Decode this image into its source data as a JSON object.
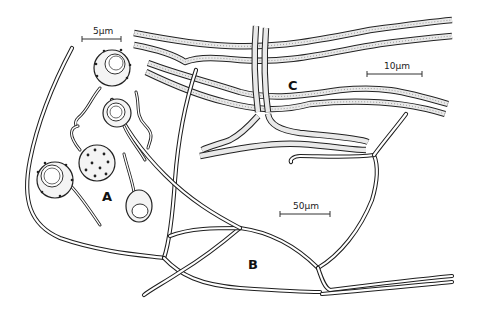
{
  "figure": {
    "panels": [
      {
        "id": "A",
        "label": "A",
        "content": "Spores with germ tubes",
        "scale_bar": "5µm"
      },
      {
        "id": "B",
        "label": "B",
        "content": "Branched hyphal network",
        "scale_bar": "50µm"
      },
      {
        "id": "C",
        "label": "C",
        "content": "Parallel septate hyphae",
        "scale_bar": "10µm"
      }
    ],
    "colors": {
      "ink": "#1e1e1e",
      "background": "#ffffff",
      "fill_stipple": "#e9e9e9"
    }
  }
}
